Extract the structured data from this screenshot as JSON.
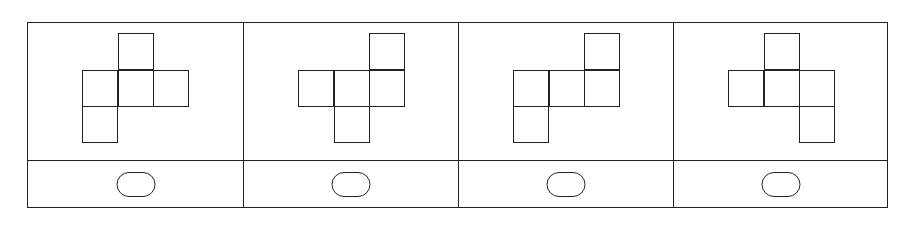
{
  "question": {
    "type": "cube-net-options",
    "line_color": "#222222",
    "options": [
      {
        "label": "A",
        "squares": [
          [
            1,
            0
          ],
          [
            0,
            1
          ],
          [
            1,
            1
          ],
          [
            2,
            1
          ],
          [
            0,
            2
          ]
        ]
      },
      {
        "label": "B",
        "squares": [
          [
            2,
            0
          ],
          [
            0,
            1
          ],
          [
            1,
            1
          ],
          [
            2,
            1
          ],
          [
            1,
            2
          ]
        ]
      },
      {
        "label": "C",
        "squares": [
          [
            2,
            0
          ],
          [
            0,
            1
          ],
          [
            1,
            1
          ],
          [
            2,
            1
          ],
          [
            0,
            2
          ]
        ]
      },
      {
        "label": "D",
        "squares": [
          [
            1,
            0
          ],
          [
            0,
            1
          ],
          [
            1,
            1
          ],
          [
            2,
            1
          ],
          [
            2,
            2
          ]
        ]
      }
    ],
    "answer_selector": "oval-radio"
  }
}
